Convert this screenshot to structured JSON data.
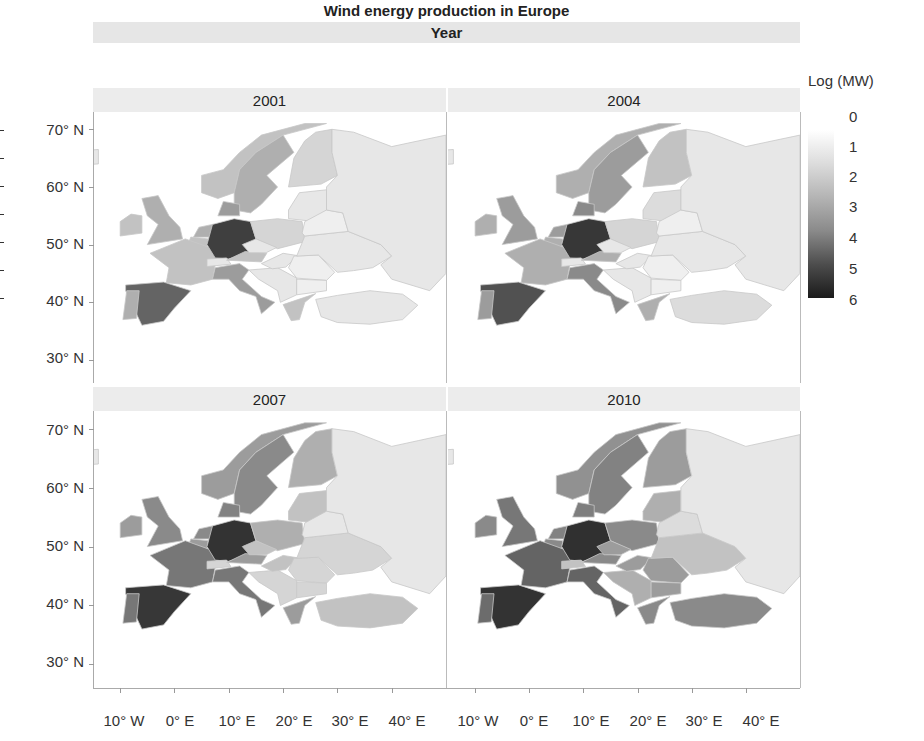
{
  "chart_data": {
    "type": "heatmap",
    "subtype": "choropleth-facet",
    "title": "Wind energy production in Europe",
    "facet_header": "Year",
    "legend": {
      "title": "Log (MW)",
      "ticks": [
        "0",
        "1",
        "2",
        "3",
        "4",
        "5",
        "6"
      ],
      "range": [
        0,
        6
      ],
      "colormap": "white-to-black"
    },
    "y_ticks": [
      "70° N",
      "60° N",
      "50° N",
      "40° N",
      "30° N"
    ],
    "x_ticks": [
      "10° W",
      "0° E",
      "10° E",
      "20° E",
      "30° E",
      "40° E"
    ],
    "xlim": [
      -15,
      50
    ],
    "ylim": [
      26,
      73
    ],
    "countries": [
      "Iceland",
      "Norway",
      "Sweden",
      "Finland",
      "UK",
      "Ireland",
      "Denmark",
      "Netherlands",
      "Belgium",
      "France",
      "Germany",
      "Poland",
      "Baltics",
      "Spain",
      "Portugal",
      "Italy",
      "Switzerland",
      "Austria",
      "Czechia",
      "Balkans",
      "Hungary",
      "Romania",
      "Bulgaria",
      "Greece",
      "Turkey",
      "Ukraine",
      "Belarus",
      "Russia"
    ],
    "panels": [
      {
        "year": "2001",
        "values": [
          0.5,
          1.5,
          2.0,
          1.0,
          2.0,
          1.5,
          2.5,
          2.0,
          1.5,
          1.5,
          5.0,
          1.0,
          0.5,
          4.0,
          2.0,
          2.5,
          0.5,
          1.5,
          0.5,
          0.5,
          0.5,
          0.3,
          0.3,
          1.5,
          0.5,
          0.5,
          0.3,
          0.5
        ]
      },
      {
        "year": "2004",
        "values": [
          0.5,
          2.0,
          2.5,
          1.5,
          2.5,
          2.0,
          3.0,
          2.5,
          2.0,
          2.0,
          5.2,
          1.0,
          0.8,
          4.5,
          2.5,
          3.0,
          0.5,
          2.0,
          0.5,
          0.5,
          0.5,
          0.3,
          0.3,
          2.0,
          0.8,
          0.5,
          0.3,
          0.5
        ]
      },
      {
        "year": "2007",
        "values": [
          0.5,
          2.5,
          3.0,
          2.0,
          3.0,
          2.5,
          3.2,
          3.0,
          2.5,
          3.5,
          5.3,
          2.0,
          1.5,
          5.2,
          3.5,
          3.5,
          1.0,
          2.5,
          1.5,
          1.0,
          1.5,
          1.0,
          1.0,
          2.5,
          1.5,
          1.0,
          0.5,
          0.5
        ]
      },
      {
        "year": "2010",
        "values": [
          0.5,
          2.8,
          3.2,
          2.5,
          3.5,
          3.0,
          3.3,
          3.2,
          3.0,
          4.0,
          5.4,
          3.0,
          2.0,
          5.3,
          3.8,
          4.0,
          1.5,
          3.0,
          2.5,
          2.0,
          2.5,
          2.5,
          2.5,
          3.0,
          3.0,
          1.5,
          0.8,
          0.5
        ]
      }
    ]
  },
  "shapes": {
    "Iceland": "-22,66 -14,66.5 -14,64 -22,63.5",
    "Norway": "5,59 8,58 11,59 12,63 15,66 20,69 28,71 24,71 16,69 12,66 9,63 5,62",
    "Sweden": "11,56 14,55.5 16,57 19,60 17,62 22,66 20,69 15,66 12,63 11,59",
    "Finland": "21,60 27,60.5 30,62 29,66 29,70 26,69.5 24,68 22,65",
    "UK": "-5,50 1.5,51 1,53 -1,55 -3,58.5 -6,58 -5,55 -3,53.5",
    "Ireland": "-10,51.5 -6,52 -6,55 -8,55.3 -10,54",
    "Denmark": "8,55 12,55 12,57 9,57.5",
    "Netherlands": "3.5,51.3 7,51.3 7,53.5 4.5,53",
    "Belgium": "2.5,50 6,49.6 6.2,51 3,51.3",
    "France": "-4.5,48.5 2,51 8,49 7,44 3,43 -1.5,43.4 -1,46",
    "Germany": "6,50 7,53.5 11,54.5 14,54 15,51 13.5,48.5 10,47.5 7.5,47.7",
    "Poland": "14,54 19,54.5 23.5,54 24,50.5 19,49.3 15,51",
    "Baltics": "21,54.5 26,54 28,56 28,59.5 23,59 21,56",
    "Spain": "-9,43 -2,43.5 3,42 0,39 -2,36.7 -6,36 -7,38 -9,42",
    "Portugal": "-9.5,37 -7,37.2 -6.5,42 -8.8,42",
    "Italy": "7,44 7.5,46 12,46.7 13.7,45.6 12.5,44 16,41 18.5,40 16,38 15,41 12,42 10,44",
    "Switzerland": "6,46.2 10.4,46.6 9.6,47.7 6,47.5",
    "Austria": "9.6,47.3 16,47 17,48.5 13,48.8",
    "Czechia": "12.5,50 15,51 18.8,49.5 16.9,48.6 13.8,48.6",
    "Balkans": "13.7,45.6 19,46 22.5,44.2 22.5,41.3 19.5,40 19,42 15.5,44",
    "Hungary": "16,46.7 20,48.5 22.7,48.1 20.5,46.1 18,45.8",
    "Romania": "22,48 26.5,48.2 29.5,45.2 28,43.8 22.5,44.2 21,46",
    "Bulgaria": "22.5,44 28,43.8 28,42 22.5,41.3",
    "Greece": "20,39.6 26,41.5 24,40 23,37 21.5,36.8",
    "Turkey": "26,40.5 30,41.2 36,42 42,41.4 44.8,39.5 42,37 36,36.2 30,36.5 27,37.5",
    "Ukraine": "22.5,48 24,51.5 32,52.3 38,50 40,48 36.5,46 33,45.5 30,45.2 26.5,48.2",
    "Belarus": "23.5,52 24,54 28,56 31,55.5 32,52.3 24,51.5",
    "Russia": "28,56 28,60 30,62 29,66 29,70 33,69.5 40,67 45,68 50,69 50,45 47,42 40,44 38,46.5 40,48 38,50 32,52.3 31,55.5"
  }
}
